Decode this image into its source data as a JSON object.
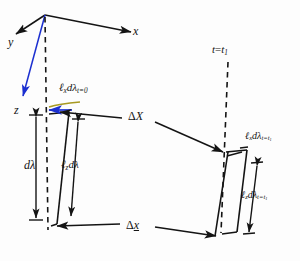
{
  "figure": {
    "background_color": "#fdfdfd",
    "line_color": "#141414",
    "accent_blue": "#1b2fd0",
    "accent_olive": "#a89a22"
  },
  "axes": {
    "y_label": "y",
    "x_label": "x",
    "z_label": "z"
  },
  "labels": {
    "t_equals_t1": {
      "base": "t",
      "eq": "=",
      "sub_base": "t",
      "sub_index": "1"
    },
    "lx_dlambda_t0": {
      "ell": "ℓ",
      "ell_sub": "x",
      "d": "d",
      "lambda": "λ",
      "sub": "t=0"
    },
    "lz_dlambda": {
      "ell": "ℓ",
      "ell_sub": "z",
      "d": "d",
      "lambda": "λ",
      "sub": ""
    },
    "d_lambda": {
      "d": "d",
      "lambda": "λ"
    },
    "delta_X": {
      "delta": "Δ",
      "var": "X"
    },
    "delta_x_under": {
      "delta": "Δ",
      "var": "x"
    },
    "lx_dlambda_t1": {
      "ell": "ℓ",
      "ell_sub": "x",
      "d": "d",
      "lambda": "λ",
      "sub_pre": "t=t",
      "sub_idx": "1"
    },
    "lz_dlambda_t1": {
      "ell": "ℓ",
      "ell_sub": "z",
      "d": "d",
      "lambda": "λ",
      "sub_pre": "t=t",
      "sub_idx": "1"
    }
  },
  "geometry": {
    "origin": {
      "x": 44,
      "y": 15
    },
    "x_axis_end": {
      "x": 133,
      "y": 33
    },
    "y_axis_end": {
      "x": 12,
      "y": 38
    },
    "z_axis_end": {
      "x": 17,
      "y": 99
    },
    "dashed_vertical_left": {
      "x1": 44,
      "y1": 15,
      "x2": 48,
      "y2": 228
    },
    "dashed_vertical_right": {
      "x1": 226,
      "y1": 62,
      "x2": 220,
      "y2": 232
    },
    "delta_X_arrow": {
      "x1": 60,
      "y1": 113,
      "x2": 222,
      "y2": 134
    },
    "delta_x_arrow": {
      "x1": 150,
      "y1": 214,
      "x2": 55,
      "y2": 228
    },
    "delta_x_arrow2": {
      "x1": 150,
      "y1": 222,
      "x2": 212,
      "y2": 230
    }
  }
}
